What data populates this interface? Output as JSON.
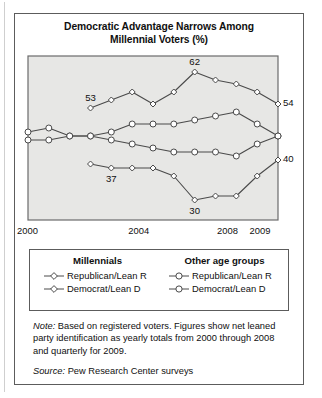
{
  "figure": {
    "title_line1": "Democratic Advantage Narrows Among",
    "title_line2": "Millennial Voters (%)"
  },
  "axis": {
    "ticks": [
      {
        "label": "2000",
        "x": 0.0
      },
      {
        "label": "2004",
        "x": 0.445
      },
      {
        "label": "2008",
        "x": 0.8
      },
      {
        "label": "2009",
        "x": 0.93
      }
    ]
  },
  "legend": {
    "columns": [
      {
        "heading": "Millennials",
        "entries": [
          {
            "label": "Republican/Lean R",
            "marker": "diamond-open"
          },
          {
            "label": "Democrat/Lean D",
            "marker": "diamond-open"
          }
        ]
      },
      {
        "heading": "Other age groups",
        "entries": [
          {
            "label": "Republican/Lean R",
            "marker": "circle-open"
          },
          {
            "label": "Democrat/Lean D",
            "marker": "circle-open"
          }
        ]
      }
    ]
  },
  "footnotes": {
    "note_lead": "Note:",
    "note_text": " Based on registered voters. Figures show net leaned party identification as yearly totals from 2000 through 2008 and quarterly for 2009.",
    "source_lead": "Source:",
    "source_text": " Pew Research Center surveys"
  },
  "colors": {
    "plot_background": "#e7e7e5",
    "plot_border": "#6b6b6b",
    "line": "#4a4a4a",
    "marker_fill": "#ffffff",
    "card_border": "#5c5c5c",
    "text": "#101010"
  },
  "chart_data": {
    "type": "line",
    "title": "Democratic Advantage Narrows Among Millennial Voters (%)",
    "xlabel": "",
    "ylabel": "",
    "ylim": [
      25,
      66
    ],
    "grid": false,
    "legend_position": "bottom",
    "x": [
      "2000",
      "2001",
      "2002",
      "2003",
      "2004",
      "2005",
      "2006",
      "2007",
      "2008",
      "2009 Q1",
      "2009 Q2",
      "2009 Q3",
      "2009 Q4"
    ],
    "series": [
      {
        "name": "Millennials Democrat/Lean D",
        "group": "Millennials",
        "party": "Democrat/Lean D",
        "marker": "diamond-open",
        "x": [
          "2003",
          "2004",
          "2005",
          "2006",
          "2007",
          "2008",
          "2009 Q1",
          "2009 Q2",
          "2009 Q3",
          "2009 Q4"
        ],
        "values": [
          53,
          55,
          57,
          54,
          57,
          62,
          60,
          59,
          57,
          54
        ],
        "labels": [
          {
            "x": "2003",
            "value": 53,
            "text": "53"
          },
          {
            "x": "2008",
            "value": 62,
            "text": "62"
          },
          {
            "x": "2009 Q4",
            "value": 54,
            "text": "54"
          }
        ]
      },
      {
        "name": "Millennials Republican/Lean R",
        "group": "Millennials",
        "party": "Republican/Lean R",
        "marker": "diamond-open",
        "x": [
          "2003",
          "2004",
          "2005",
          "2006",
          "2007",
          "2008",
          "2009 Q1",
          "2009 Q2",
          "2009 Q3",
          "2009 Q4"
        ],
        "values": [
          39,
          38,
          38,
          38,
          36,
          30,
          31,
          31,
          36,
          40
        ],
        "labels": [
          {
            "x": "2004",
            "value": 38,
            "text": "37"
          },
          {
            "x": "2008",
            "value": 30,
            "text": "30"
          },
          {
            "x": "2009 Q4",
            "value": 40,
            "text": "40"
          }
        ]
      },
      {
        "name": "Other age groups Democrat/Lean D",
        "group": "Other age groups",
        "party": "Democrat/Lean D",
        "marker": "circle-open",
        "x": [
          "2000",
          "2001",
          "2002",
          "2003",
          "2004",
          "2005",
          "2006",
          "2007",
          "2008",
          "2009 Q1",
          "2009 Q2",
          "2009 Q3",
          "2009 Q4"
        ],
        "values": [
          47,
          48,
          46,
          46,
          47,
          49,
          49,
          49,
          50,
          51,
          52,
          49,
          46
        ],
        "labels": []
      },
      {
        "name": "Other age groups Republican/Lean R",
        "group": "Other age groups",
        "party": "Republican/Lean R",
        "marker": "circle-open",
        "x": [
          "2000",
          "2001",
          "2002",
          "2003",
          "2004",
          "2005",
          "2006",
          "2007",
          "2008",
          "2009 Q1",
          "2009 Q2",
          "2009 Q3",
          "2009 Q4"
        ],
        "values": [
          45,
          45,
          46,
          46,
          45,
          44,
          43,
          42,
          42,
          42,
          41,
          44,
          46
        ],
        "labels": []
      }
    ],
    "end_labels": [
      {
        "text": "54",
        "series": "Millennials Democrat/Lean D"
      },
      {
        "text": "40",
        "series": "Millennials Republican/Lean R"
      }
    ]
  }
}
